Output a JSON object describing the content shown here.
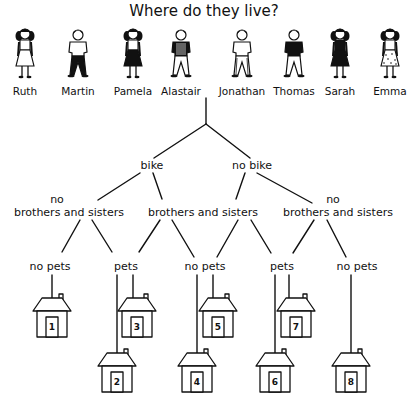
{
  "title": "Where do they live?",
  "people": [
    {
      "name": "Ruth",
      "x": 25,
      "gender": "girl",
      "outfit": "dress-white"
    },
    {
      "name": "Martin",
      "x": 78,
      "gender": "boy",
      "outfit": "dark-trousers"
    },
    {
      "name": "Pamela",
      "x": 133,
      "gender": "girl",
      "outfit": "dark-skirt"
    },
    {
      "name": "Alastair",
      "x": 181,
      "gender": "boy",
      "outfit": "striped-shirt"
    },
    {
      "name": "Jonathan",
      "x": 242,
      "gender": "boy",
      "outfit": "striped-trousers"
    },
    {
      "name": "Thomas",
      "x": 294,
      "gender": "boy",
      "outfit": "dark-shirt"
    },
    {
      "name": "Sarah",
      "x": 340,
      "gender": "girl",
      "outfit": "dark-dress"
    },
    {
      "name": "Emma",
      "x": 390,
      "gender": "girl",
      "outfit": "spotted-dress"
    }
  ],
  "tree": {
    "level1": [
      {
        "id": "bike",
        "label": "bike",
        "x": 152
      },
      {
        "id": "no-bike",
        "label": "no bike",
        "x": 252
      }
    ],
    "level2": [
      {
        "id": "bike-no-siblings",
        "prefix": "no",
        "label": "brothers and sisters",
        "x": 69,
        "prefix_x": 57
      },
      {
        "id": "shared-siblings",
        "prefix": "",
        "label": "brothers and sisters",
        "x": 203,
        "prefix_x": 0
      },
      {
        "id": "nobike-no-siblings",
        "prefix": "no",
        "label": "brothers and sisters",
        "x": 338,
        "prefix_x": 333
      }
    ],
    "level3": [
      {
        "id": "no-pets-1",
        "label": "no pets",
        "x": 50
      },
      {
        "id": "pets-1",
        "label": "pets",
        "x": 126
      },
      {
        "id": "no-pets-2",
        "label": "no pets",
        "x": 205
      },
      {
        "id": "pets-2",
        "label": "pets",
        "x": 282
      },
      {
        "id": "no-pets-3",
        "label": "no pets",
        "x": 357
      }
    ]
  },
  "houses": [
    {
      "number": "1",
      "x": 52,
      "y": 298,
      "line_x": 52
    },
    {
      "number": "2",
      "x": 117,
      "y": 353,
      "line_x": 117
    },
    {
      "number": "3",
      "x": 137,
      "y": 298,
      "line_x": 133
    },
    {
      "number": "4",
      "x": 197,
      "y": 353,
      "line_x": 197
    },
    {
      "number": "5",
      "x": 218,
      "y": 298,
      "line_x": 213
    },
    {
      "number": "6",
      "x": 275,
      "y": 353,
      "line_x": 275
    },
    {
      "number": "7",
      "x": 296,
      "y": 298,
      "line_x": 289
    },
    {
      "number": "8",
      "x": 351,
      "y": 353,
      "line_x": 351
    }
  ]
}
